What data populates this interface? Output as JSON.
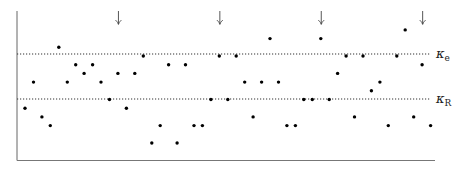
{
  "chart_data": {
    "type": "scatter",
    "title": "",
    "xlabel": "",
    "ylabel": "",
    "grid": false,
    "x": [
      1,
      2,
      3,
      4,
      5,
      6,
      7,
      8,
      9,
      10,
      11,
      12,
      13,
      14,
      15,
      16,
      17,
      18,
      19,
      20,
      21,
      22,
      23,
      24,
      25,
      26,
      27,
      28,
      29,
      30,
      31,
      32,
      33,
      34,
      35,
      36,
      37,
      38,
      39,
      40,
      41,
      42,
      43,
      44,
      45,
      46,
      47,
      48,
      49
    ],
    "values": [
      4,
      7,
      3,
      2,
      11,
      7,
      9,
      8,
      9,
      7,
      5,
      8,
      4,
      8,
      10,
      0,
      2,
      9,
      0,
      9,
      2,
      2,
      5,
      10,
      5,
      10,
      7,
      3,
      7,
      12,
      7,
      2,
      2,
      5,
      5,
      12,
      5,
      8,
      10,
      3,
      10,
      6,
      7,
      2,
      10,
      13,
      3,
      9,
      2
    ],
    "ylim": [
      -2,
      15
    ],
    "xlim": [
      0,
      50
    ],
    "thresholds": [
      {
        "name": "kappa_e",
        "label": "κ",
        "subscript": "e",
        "value": 10.2
      },
      {
        "name": "kappa_R",
        "label": "κ",
        "subscript": "R",
        "value": 5
      }
    ],
    "markers": {
      "type": "down-arrow",
      "x": [
        12,
        24,
        36,
        48
      ]
    },
    "legend": null
  },
  "labels": {
    "kappa_e": "κ",
    "kappa_e_sub": "e",
    "kappa_R": "κ",
    "kappa_R_sub": "R"
  },
  "colors": {
    "points": "#000000",
    "axes": "#555555",
    "dotted": "#333333"
  }
}
